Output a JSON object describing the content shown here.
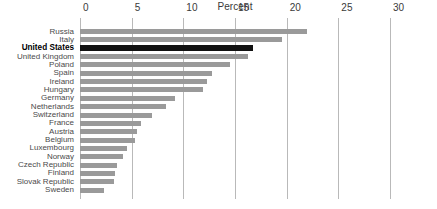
{
  "chart_data": {
    "type": "bar",
    "orientation": "horizontal",
    "title": "Percent",
    "xlabel": "",
    "ylabel": "",
    "xlim": [
      0,
      30
    ],
    "xticks": [
      0,
      5,
      10,
      15,
      20,
      25,
      30
    ],
    "xtick_labels": [
      "0",
      "5",
      "10",
      "15",
      "20",
      "25",
      "30"
    ],
    "grid": true,
    "legend": false,
    "highlight_category": "United States",
    "colors": {
      "bar": "#9a9a9a",
      "bar_highlight": "#111111",
      "gridline": "#b9b9b9",
      "text": "#4a4a4a",
      "background": "#ffffff"
    },
    "categories": [
      "Russia",
      "Italy",
      "United States",
      "United Kingdom",
      "Poland",
      "Spain",
      "Ireland",
      "Hungary",
      "Germany",
      "Netherlands",
      "Switzerland",
      "France",
      "Austria",
      "Belgium",
      "Luxembourg",
      "Norway",
      "Czech Republic",
      "Finland",
      "Slovak Republic",
      "Sweden"
    ],
    "values": [
      22.0,
      19.5,
      16.7,
      16.3,
      14.5,
      12.8,
      12.3,
      11.9,
      9.2,
      8.3,
      7.0,
      5.9,
      5.5,
      5.3,
      4.5,
      4.2,
      3.6,
      3.4,
      3.3,
      2.3
    ]
  }
}
